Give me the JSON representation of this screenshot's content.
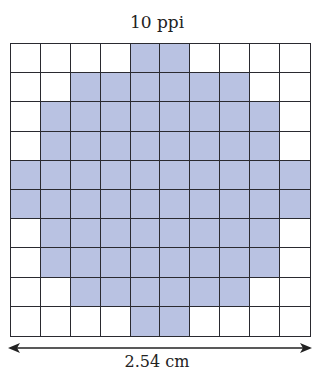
{
  "title": "10 ppi",
  "dimension_label": "2.54 cm",
  "grid": {
    "rows": 10,
    "cols": 10,
    "fill_color": "#b9c2e2",
    "empty_color": "#ffffff",
    "line_color": "#2a2a30",
    "filled": [
      [
        0,
        0,
        0,
        0,
        1,
        1,
        0,
        0,
        0,
        0
      ],
      [
        0,
        0,
        1,
        1,
        1,
        1,
        1,
        1,
        0,
        0
      ],
      [
        0,
        1,
        1,
        1,
        1,
        1,
        1,
        1,
        1,
        0
      ],
      [
        0,
        1,
        1,
        1,
        1,
        1,
        1,
        1,
        1,
        0
      ],
      [
        1,
        1,
        1,
        1,
        1,
        1,
        1,
        1,
        1,
        1
      ],
      [
        1,
        1,
        1,
        1,
        1,
        1,
        1,
        1,
        1,
        1
      ],
      [
        0,
        1,
        1,
        1,
        1,
        1,
        1,
        1,
        1,
        0
      ],
      [
        0,
        1,
        1,
        1,
        1,
        1,
        1,
        1,
        1,
        0
      ],
      [
        0,
        0,
        1,
        1,
        1,
        1,
        1,
        1,
        0,
        0
      ],
      [
        0,
        0,
        0,
        0,
        1,
        1,
        0,
        0,
        0,
        0
      ]
    ]
  }
}
